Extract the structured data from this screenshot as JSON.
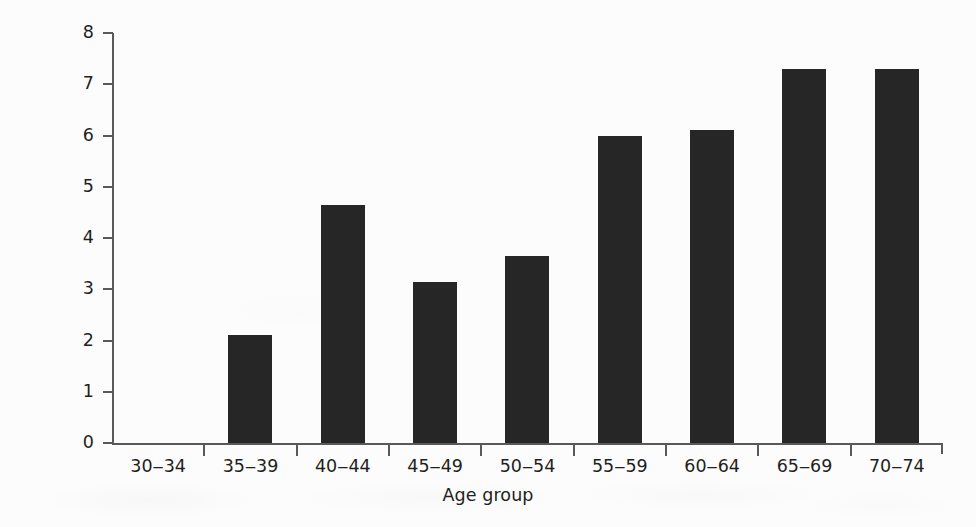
{
  "chart_data": {
    "type": "bar",
    "title": "",
    "subtitle": "",
    "xlabel": "Age group",
    "ylabel": "Incidence/1000/year",
    "categories": [
      "30‒34",
      "35‒39",
      "40‒44",
      "45‒49",
      "50‒54",
      "55‒59",
      "60‒64",
      "65‒69",
      "70‒74"
    ],
    "values": [
      0,
      2.1,
      4.65,
      3.15,
      3.65,
      6.0,
      6.1,
      7.3,
      7.3
    ],
    "ylim": [
      0,
      8
    ],
    "xlim_categories": 9,
    "y_ticks": [
      0,
      1,
      2,
      3,
      4,
      5,
      6,
      7,
      8
    ],
    "y_tick_labels": [
      "0",
      "1",
      "2",
      "3",
      "4",
      "5",
      "6",
      "7",
      "8"
    ],
    "grid": false,
    "legend": null,
    "legend_position": "none",
    "annotations": [],
    "series": [
      {
        "name": "Incidence",
        "values": [
          0,
          2.1,
          4.65,
          3.15,
          3.65,
          6.0,
          6.1,
          7.3,
          7.3
        ]
      }
    ]
  },
  "style": {
    "bar_color": "#262626",
    "axis_color": "#58595b",
    "text_color": "#231f20",
    "background_color": "#fcfcfc"
  }
}
